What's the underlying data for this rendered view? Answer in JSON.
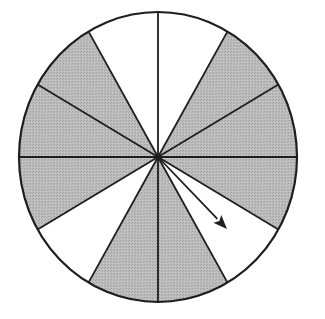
{
  "spinner": {
    "description": "Spinner divided into 12 equal sectors, 8 shaded and 4 unshaded, with an arrow pointer",
    "center": [
      158,
      157
    ],
    "radius_x": 139,
    "radius_y": 145,
    "sector_count": 12,
    "sector_angle_deg": 30,
    "colors": {
      "shaded": "#b4b4b4",
      "unshaded": "#ffffff",
      "stroke": "#1e1e1e"
    },
    "sectors": [
      {
        "start_deg": 0,
        "end_deg": 30,
        "shaded": true
      },
      {
        "start_deg": 30,
        "end_deg": 60,
        "shaded": true
      },
      {
        "start_deg": 60,
        "end_deg": 90,
        "shaded": false
      },
      {
        "start_deg": 90,
        "end_deg": 120,
        "shaded": false
      },
      {
        "start_deg": 120,
        "end_deg": 150,
        "shaded": true
      },
      {
        "start_deg": 150,
        "end_deg": 180,
        "shaded": true
      },
      {
        "start_deg": 180,
        "end_deg": 210,
        "shaded": true
      },
      {
        "start_deg": 210,
        "end_deg": 240,
        "shaded": false
      },
      {
        "start_deg": 240,
        "end_deg": 270,
        "shaded": true
      },
      {
        "start_deg": 270,
        "end_deg": 300,
        "shaded": true
      },
      {
        "start_deg": 300,
        "end_deg": 330,
        "shaded": false
      },
      {
        "start_deg": 330,
        "end_deg": 360,
        "shaded": true
      }
    ],
    "shaded_count": 8,
    "unshaded_count": 4,
    "arrow": {
      "from": [
        158,
        157
      ],
      "to": [
        227,
        229
      ],
      "points_to_sector_index": 10
    }
  }
}
